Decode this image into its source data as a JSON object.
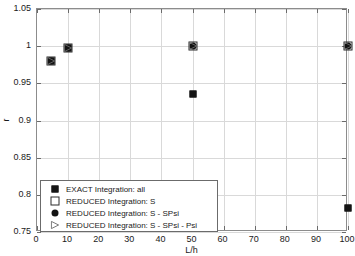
{
  "chart_data": {
    "type": "scatter",
    "title": "",
    "xlabel": "L/h",
    "ylabel": "r",
    "xlim": [
      0,
      100
    ],
    "ylim": [
      0.75,
      1.05
    ],
    "xticks": [
      0,
      10,
      20,
      30,
      40,
      50,
      60,
      70,
      80,
      90,
      100
    ],
    "xticklabels": [
      "0",
      "10",
      "20",
      "30",
      "40",
      "50",
      "60",
      "70",
      "80",
      "90",
      "100"
    ],
    "yticks": [
      0.75,
      0.8,
      0.85,
      0.9,
      0.95,
      1.0,
      1.05
    ],
    "yticklabels": [
      "0.75",
      "0.8",
      "0.85",
      "0.9",
      "0.95",
      "1",
      "1.05"
    ],
    "grid": true,
    "legend_position": "lower-left",
    "series": [
      {
        "name": "EXACT Integration: all",
        "marker": "square-filled",
        "color": "#141414",
        "points": [
          {
            "x": 4.5,
            "y": 0.98
          },
          {
            "x": 10,
            "y": 0.997
          },
          {
            "x": 50,
            "y": 0.935
          },
          {
            "x": 100,
            "y": 0.782
          }
        ]
      },
      {
        "name": "REDUCED Integration: S",
        "marker": "square-open",
        "color": "#2b2b2b",
        "points": [
          {
            "x": 4.5,
            "y": 0.98
          },
          {
            "x": 10,
            "y": 0.998
          },
          {
            "x": 50,
            "y": 1.0
          },
          {
            "x": 100,
            "y": 1.0
          }
        ]
      },
      {
        "name": "REDUCED Integration: S - SPsi",
        "marker": "circle-filled",
        "color": "#141414",
        "points": [
          {
            "x": 4.5,
            "y": 0.98
          },
          {
            "x": 10,
            "y": 0.998
          },
          {
            "x": 50,
            "y": 1.0
          },
          {
            "x": 100,
            "y": 1.0
          }
        ]
      },
      {
        "name": "REDUCED Integration: S - SPsi - Psi",
        "marker": "triangle-right",
        "color": "#6b6b6b",
        "points": [
          {
            "x": 4.5,
            "y": 0.98
          },
          {
            "x": 10,
            "y": 0.998
          },
          {
            "x": 50,
            "y": 1.0
          },
          {
            "x": 100,
            "y": 1.0
          }
        ]
      }
    ]
  },
  "legend": {
    "entries": [
      {
        "label": "EXACT Integration: all",
        "marker": "square-filled"
      },
      {
        "label": "REDUCED Integration: S",
        "marker": "square-open"
      },
      {
        "label": "REDUCED Integration: S - SPsi",
        "marker": "circle-filled"
      },
      {
        "label": "REDUCED Integration: S - SPsi - Psi",
        "marker": "triangle-right"
      }
    ]
  },
  "axes": {
    "x_axis_label": "L/h",
    "y_axis_label": "r"
  }
}
